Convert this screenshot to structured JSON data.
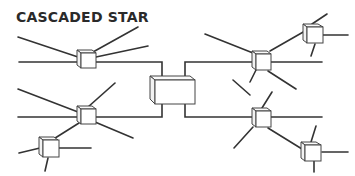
{
  "title": "CASCADED STAR",
  "diagram": {
    "type": "network-topology",
    "topology": "cascaded star",
    "nodes": [
      {
        "id": "central-hub",
        "role": "central hub"
      },
      {
        "id": "hub-top-left",
        "role": "hub"
      },
      {
        "id": "hub-bottom-left",
        "role": "hub"
      },
      {
        "id": "hub-bottom-left-sub",
        "role": "sub-hub"
      },
      {
        "id": "hub-top-right",
        "role": "hub"
      },
      {
        "id": "hub-top-right-sub",
        "role": "sub-hub"
      },
      {
        "id": "hub-bottom-right",
        "role": "hub"
      },
      {
        "id": "hub-bottom-right-sub",
        "role": "sub-hub"
      }
    ],
    "edges": [
      [
        "central-hub",
        "hub-top-left"
      ],
      [
        "central-hub",
        "hub-bottom-left"
      ],
      [
        "central-hub",
        "hub-top-right"
      ],
      [
        "central-hub",
        "hub-bottom-right"
      ],
      [
        "hub-bottom-left",
        "hub-bottom-left-sub"
      ],
      [
        "hub-top-right",
        "hub-top-right-sub"
      ],
      [
        "hub-bottom-right",
        "hub-bottom-right-sub"
      ]
    ],
    "colors": {
      "line": "#333333",
      "box_fill": "#ffffff",
      "text": "#2a2a2a"
    }
  }
}
